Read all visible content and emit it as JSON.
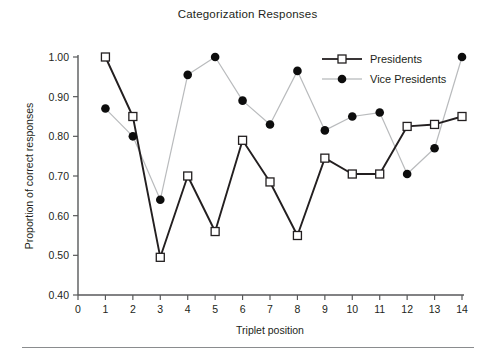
{
  "chart_data": {
    "type": "line",
    "title": "Categorization Responses",
    "xlabel": "Triplet position",
    "ylabel": "Proportion of correct responses",
    "x": [
      1,
      2,
      3,
      4,
      5,
      6,
      7,
      8,
      9,
      10,
      11,
      12,
      13,
      14
    ],
    "xlim": [
      0,
      14
    ],
    "ylim": [
      0.4,
      1.0
    ],
    "xticks": [
      0,
      1,
      2,
      3,
      4,
      5,
      6,
      7,
      8,
      9,
      10,
      11,
      12,
      13,
      14
    ],
    "xtick_labels": [
      "0",
      "1",
      "2",
      "3",
      "4",
      "5",
      "6",
      "7",
      "8",
      "9",
      "10",
      "11",
      "12",
      "13",
      "14"
    ],
    "yticks": [
      0.4,
      0.5,
      0.6,
      0.7,
      0.8,
      0.9,
      1.0
    ],
    "ytick_labels": [
      "0.40",
      "0.50",
      "0.60",
      "0.70",
      "0.80",
      "0.90",
      "1.00"
    ],
    "grid": false,
    "legend_position": "top-right",
    "series": [
      {
        "name": "Presidents",
        "marker": "open-square",
        "line_color": "#231f20",
        "marker_fill": "#ffffff",
        "values": [
          1.0,
          0.85,
          0.495,
          0.7,
          0.56,
          0.79,
          0.685,
          0.55,
          0.745,
          0.705,
          0.705,
          0.825,
          0.83,
          0.85
        ]
      },
      {
        "name": "Vice Presidents",
        "marker": "filled-circle",
        "line_color": "#b9bbbd",
        "marker_fill": "#0d0d0d",
        "values": [
          0.87,
          0.8,
          0.64,
          0.955,
          1.0,
          0.89,
          0.83,
          0.965,
          0.815,
          0.85,
          0.86,
          0.705,
          0.77,
          1.0
        ]
      }
    ]
  },
  "legend": {
    "entries": [
      {
        "label": "Presidents"
      },
      {
        "label": "Vice Presidents"
      }
    ]
  }
}
